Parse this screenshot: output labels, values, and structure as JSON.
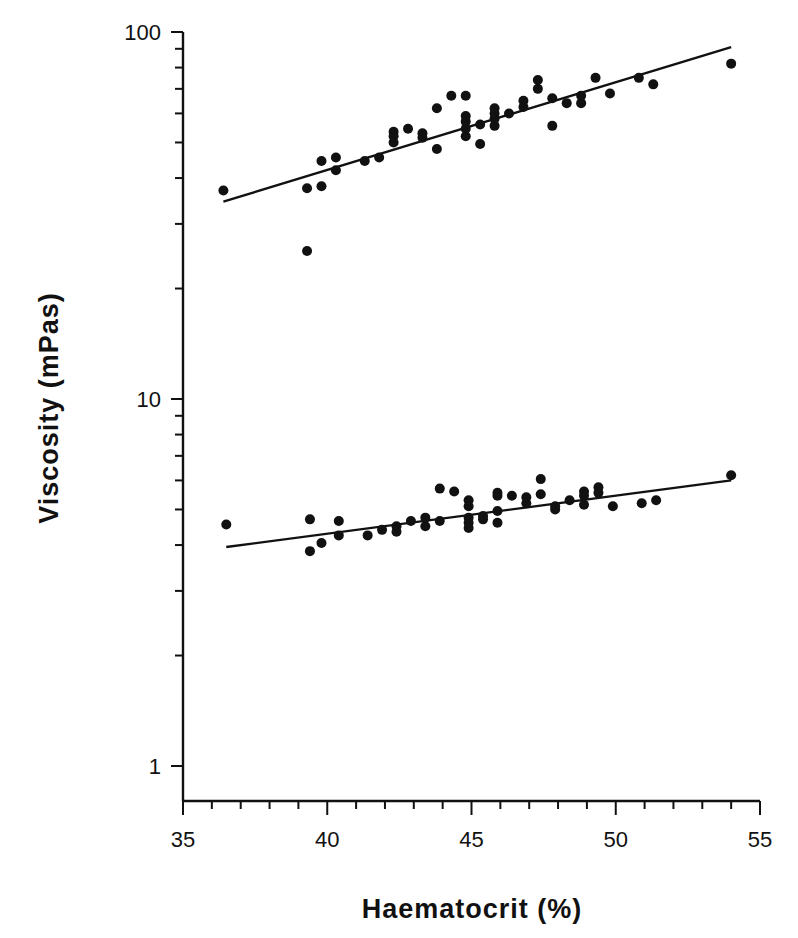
{
  "chart_data": {
    "type": "scatter",
    "title": "",
    "xlabel": "Haematocrit (%)",
    "ylabel": "Viscosity (mPas)",
    "xlim": [
      35,
      55
    ],
    "ylim": [
      0.8,
      100
    ],
    "yscale": "log",
    "x_ticks": [
      35,
      40,
      45,
      50,
      55
    ],
    "x_minor_step": 1,
    "y_ticks": [
      1,
      10,
      100
    ],
    "y_tick_labels": [
      "1",
      "10",
      "100"
    ],
    "grid": false,
    "legend": null,
    "series": [
      {
        "name": "upper",
        "points": [
          [
            36.4,
            37.0
          ],
          [
            39.3,
            25.3
          ],
          [
            39.3,
            37.5
          ],
          [
            39.8,
            38.0
          ],
          [
            39.8,
            44.5
          ],
          [
            40.3,
            45.5
          ],
          [
            40.3,
            42.0
          ],
          [
            41.3,
            44.5
          ],
          [
            41.8,
            45.5
          ],
          [
            42.3,
            50.0
          ],
          [
            42.3,
            52.0
          ],
          [
            42.3,
            53.5
          ],
          [
            42.8,
            54.5
          ],
          [
            43.3,
            51.5
          ],
          [
            43.3,
            53.0
          ],
          [
            43.8,
            48.0
          ],
          [
            43.8,
            62.0
          ],
          [
            44.3,
            67.0
          ],
          [
            44.8,
            67.0
          ],
          [
            44.8,
            52.0
          ],
          [
            44.8,
            54.5
          ],
          [
            44.8,
            57.0
          ],
          [
            44.8,
            59.0
          ],
          [
            45.3,
            49.5
          ],
          [
            45.3,
            56.0
          ],
          [
            45.8,
            55.5
          ],
          [
            45.8,
            58.0
          ],
          [
            45.8,
            60.0
          ],
          [
            45.8,
            62.0
          ],
          [
            46.3,
            60.0
          ],
          [
            46.8,
            62.5
          ],
          [
            46.8,
            65.0
          ],
          [
            47.3,
            70.0
          ],
          [
            47.3,
            74.0
          ],
          [
            47.8,
            55.5
          ],
          [
            47.8,
            66.0
          ],
          [
            48.3,
            64.0
          ],
          [
            48.8,
            64.0
          ],
          [
            48.8,
            67.0
          ],
          [
            49.3,
            75.0
          ],
          [
            49.8,
            68.0
          ],
          [
            50.8,
            75.0
          ],
          [
            51.3,
            72.0
          ],
          [
            54.0,
            82.0
          ]
        ],
        "fit_line": {
          "x": [
            36.4,
            54.0
          ],
          "y": [
            34.5,
            91.0
          ]
        }
      },
      {
        "name": "lower",
        "points": [
          [
            36.5,
            4.55
          ],
          [
            39.4,
            3.85
          ],
          [
            39.4,
            4.7
          ],
          [
            39.8,
            4.05
          ],
          [
            40.4,
            4.25
          ],
          [
            40.4,
            4.65
          ],
          [
            41.4,
            4.25
          ],
          [
            41.9,
            4.4
          ],
          [
            42.4,
            4.35
          ],
          [
            42.4,
            4.5
          ],
          [
            42.9,
            4.65
          ],
          [
            43.4,
            4.5
          ],
          [
            43.4,
            4.75
          ],
          [
            43.9,
            4.65
          ],
          [
            43.9,
            5.7
          ],
          [
            44.4,
            5.6
          ],
          [
            44.9,
            4.45
          ],
          [
            44.9,
            4.6
          ],
          [
            44.9,
            4.75
          ],
          [
            44.9,
            5.1
          ],
          [
            44.9,
            5.3
          ],
          [
            45.4,
            4.7
          ],
          [
            45.4,
            4.8
          ],
          [
            45.9,
            4.6
          ],
          [
            45.9,
            4.95
          ],
          [
            45.9,
            5.45
          ],
          [
            45.9,
            5.55
          ],
          [
            46.4,
            5.45
          ],
          [
            46.9,
            5.2
          ],
          [
            46.9,
            5.4
          ],
          [
            47.4,
            5.5
          ],
          [
            47.4,
            6.05
          ],
          [
            47.9,
            5.0
          ],
          [
            47.9,
            5.1
          ],
          [
            48.4,
            5.3
          ],
          [
            48.9,
            5.15
          ],
          [
            48.9,
            5.45
          ],
          [
            48.9,
            5.6
          ],
          [
            49.4,
            5.55
          ],
          [
            49.4,
            5.75
          ],
          [
            49.9,
            5.1
          ],
          [
            50.9,
            5.2
          ],
          [
            51.4,
            5.3
          ],
          [
            54.0,
            6.2
          ]
        ],
        "fit_line": {
          "x": [
            36.5,
            54.0
          ],
          "y": [
            3.95,
            6.0
          ]
        }
      }
    ]
  },
  "axes": {
    "x_title": "Haematocrit (%)",
    "y_title": "Viscosity (mPas)",
    "x_labels": [
      "35",
      "40",
      "45",
      "50",
      "55"
    ],
    "y_labels": [
      "1",
      "10",
      "100"
    ]
  },
  "colors": {
    "ink": "#111111",
    "background": "#ffffff"
  }
}
